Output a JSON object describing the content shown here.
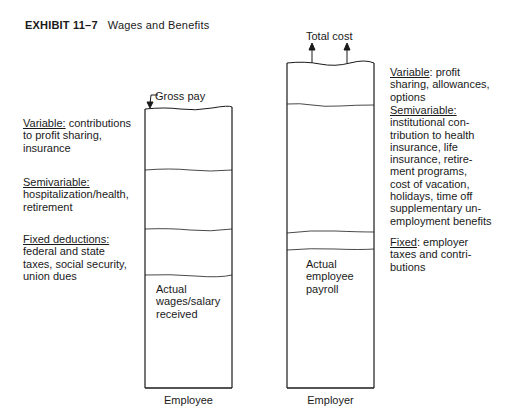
{
  "title": {
    "exhibit": "EXHIBIT 11–7",
    "text": "Wages and Benefits"
  },
  "employee": {
    "top_label": "Gross pay",
    "caption": "Employee",
    "left_labels": [
      {
        "heading": "Variable:",
        "body": " contributions\nto profit sharing,\ninsurance"
      },
      {
        "heading": "Semivariable:",
        "body": "\nhospitalization/health,\nretirement"
      },
      {
        "heading": "Fixed deductions:",
        "body": "\nfederal and state\ntaxes, social security,\nunion dues"
      }
    ],
    "inner_label": "Actual\nwages/salary\nreceived"
  },
  "employer": {
    "top_label": "Total cost",
    "caption": "Employer",
    "right_labels": [
      {
        "heading": "Variable",
        "body": ": profit\nsharing, allowances,\noptions"
      },
      {
        "heading": "Semivariable:",
        "body": "\ninstitutional con-\ntribution to health\ninsurance, life\ninsurance, retire-\nment programs,\ncost of vacation,\nholidays, time off\nsupplementary un-\nemployment benefits"
      },
      {
        "heading": "Fixed",
        "body": ": employer\ntaxes and contri-\nbutions"
      }
    ],
    "inner_label": "Actual\nemployee\npayroll"
  }
}
